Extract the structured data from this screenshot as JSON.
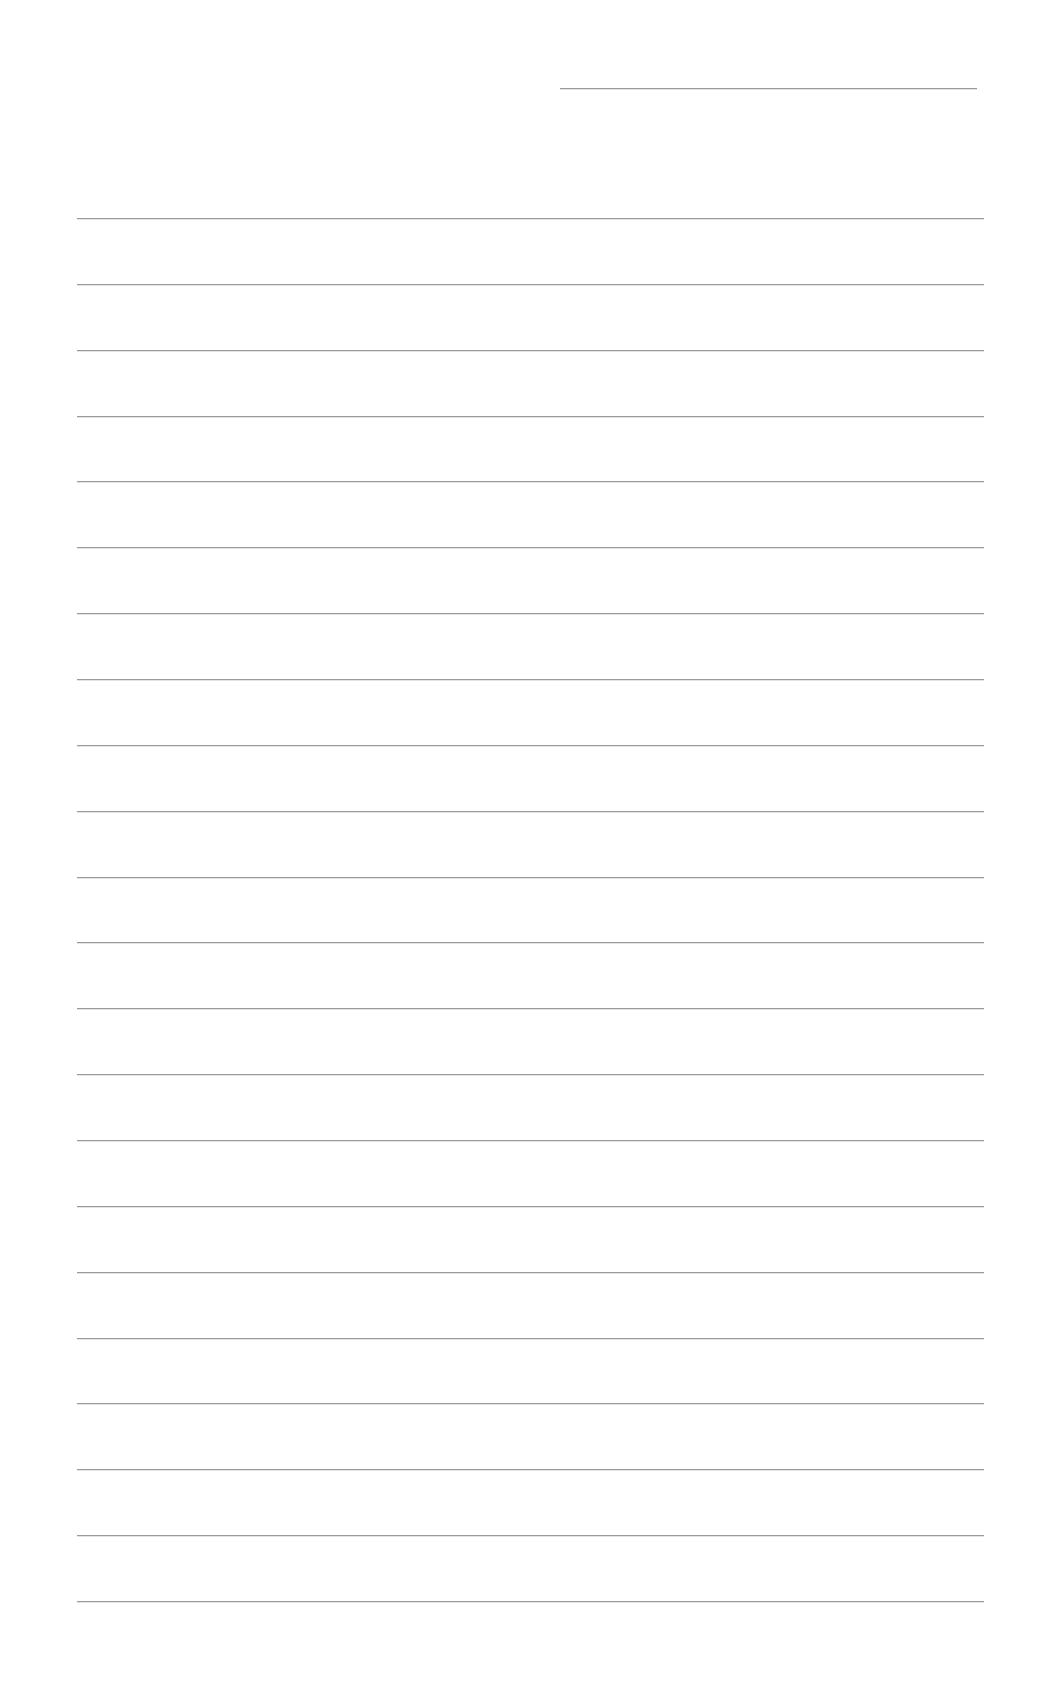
{
  "document": {
    "type": "lined-paper",
    "header_line": {
      "x": 560,
      "y": 88,
      "width": 417
    },
    "ruled_lines": {
      "count": 22,
      "x": 77,
      "width": 907,
      "start_y": 218,
      "spacing": 65.86
    },
    "line_color": "#8a8a8a",
    "background": "#ffffff"
  }
}
